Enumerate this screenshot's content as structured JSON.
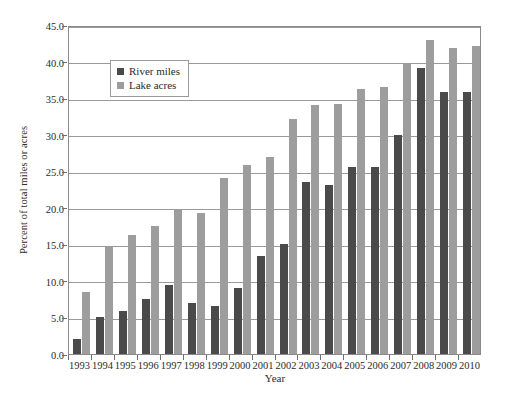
{
  "chart_data": {
    "type": "bar",
    "title": "",
    "xlabel": "Year",
    "ylabel": "Percent of total miles or acres",
    "categories": [
      "1993",
      "1994",
      "1995",
      "1996",
      "1997",
      "1998",
      "1999",
      "2000",
      "2001",
      "2002",
      "2003",
      "2004",
      "2005",
      "2006",
      "2007",
      "2008",
      "2009",
      "2010"
    ],
    "series": [
      {
        "name": "River miles",
        "color": "#4a4a4a",
        "values": [
          2.1,
          5.1,
          5.9,
          7.5,
          9.4,
          7.0,
          6.6,
          9.0,
          13.4,
          15.0,
          23.5,
          23.1,
          25.6,
          25.6,
          30.0,
          39.1,
          35.8,
          35.8
        ]
      },
      {
        "name": "Lake acres",
        "color": "#9d9d9d",
        "values": [
          8.5,
          14.6,
          16.3,
          17.5,
          19.9,
          19.3,
          24.1,
          25.8,
          27.0,
          32.1,
          34.1,
          34.2,
          36.2,
          36.5,
          39.8,
          42.9,
          41.9,
          42.1
        ]
      }
    ],
    "ylim": [
      0,
      45
    ],
    "ytick_labels": [
      "0.0",
      "5.0",
      "10.0",
      "15.0",
      "20.0",
      "25.0",
      "30.0",
      "35.0",
      "40.0",
      "45.0"
    ],
    "ytick_values": [
      0,
      5,
      10,
      15,
      20,
      25,
      30,
      35,
      40,
      45
    ],
    "grid": true,
    "legend_position": "upper left inside"
  },
  "legend": {
    "entries": [
      {
        "label": "River miles"
      },
      {
        "label": "Lake acres"
      }
    ]
  }
}
